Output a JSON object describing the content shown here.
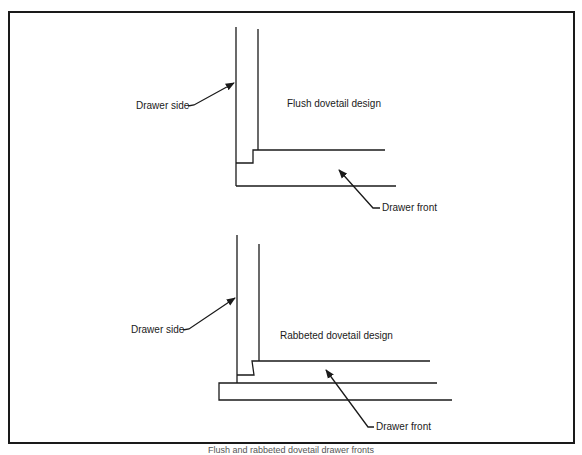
{
  "figure": {
    "stroke_color": "#1a1a1a",
    "top_diagram": {
      "title": "Flush dovetail design",
      "side_label": "Drawer side",
      "front_label": "Drawer front"
    },
    "bottom_diagram": {
      "title": "Rabbeted dovetail design",
      "side_label": "Drawer side",
      "front_label": "Drawer front"
    },
    "caption": "Flush and rabbeted dovetail drawer fronts"
  }
}
